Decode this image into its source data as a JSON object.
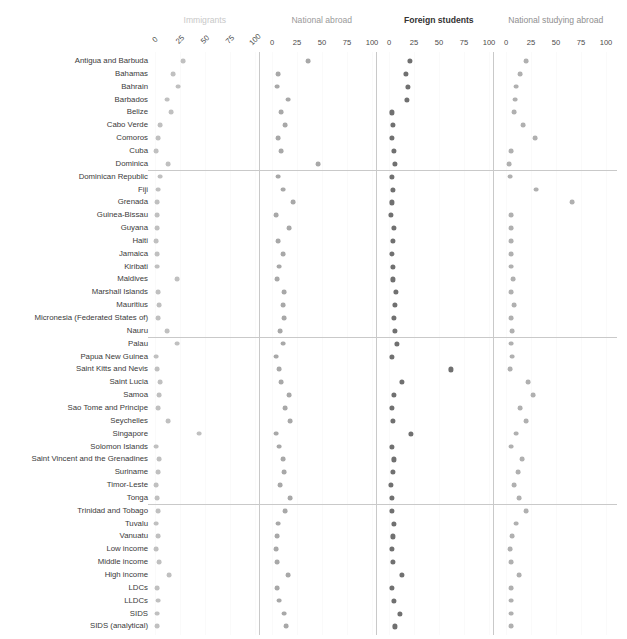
{
  "title": "",
  "facets": [
    {
      "key": "immigrants",
      "label": "Immigrants",
      "color": "#c8c8c8",
      "bold": false,
      "ticks": [
        "0",
        "25",
        "50",
        "75",
        "100"
      ],
      "rotated": true
    },
    {
      "key": "national_abroad",
      "label": "National abroad",
      "color": "#9a9a9a",
      "bold": false,
      "ticks": [
        "0",
        "25",
        "50",
        "75",
        "100"
      ],
      "rotated": false
    },
    {
      "key": "foreign_students",
      "label": "Foreign students",
      "color": "#333333",
      "bold": true,
      "ticks": [
        "0",
        "25",
        "50",
        "75",
        "100"
      ],
      "rotated": false
    },
    {
      "key": "national_studying_abroad",
      "label": "National studying abroad",
      "color": "#8f8f8f",
      "bold": false,
      "ticks": [
        "0",
        "25",
        "50",
        "75",
        "100"
      ],
      "rotated": false
    }
  ],
  "axis": {
    "min": 0,
    "max": 100,
    "tick_step": 25
  },
  "group_separator_rows": [
    9,
    22,
    35
  ],
  "chart_data": {
    "type": "scatter",
    "title": "",
    "xlabel": "",
    "ylabel": "",
    "xlim": [
      0,
      100
    ],
    "grid": true,
    "legend": "none",
    "categories": [
      "Antigua and Barbuda",
      "Bahamas",
      "Bahrain",
      "Barbados",
      "Belize",
      "Cabo Verde",
      "Comoros",
      "Cuba",
      "Dominica",
      "Dominican Republic",
      "Fiji",
      "Grenada",
      "Guinea-Bissau",
      "Guyana",
      "Haiti",
      "Jamaica",
      "Kiribati",
      "Maldives",
      "Marshall Islands",
      "Mauritius",
      "Micronesia (Federated States of)",
      "Nauru",
      "Palau",
      "Papua New Guinea",
      "Saint Kitts and Nevis",
      "Saint Lucia",
      "Samoa",
      "Sao Tome and Principe",
      "Seychelles",
      "Singapore",
      "Solomon Islands",
      "Saint Vincent and the Grenadines",
      "Suriname",
      "Timor-Leste",
      "Tonga",
      "Trinidad and Tobago",
      "Tuvalu",
      "Vanuatu",
      "Low income",
      "Middle income",
      "High income",
      "LDCs",
      "LLDCs",
      "SIDS",
      "SIDS (analytical)"
    ],
    "series": [
      {
        "name": "Immigrants",
        "color": "#c0c0c0",
        "values": [
          28,
          18,
          23,
          12,
          16,
          5,
          3,
          1,
          13,
          5,
          3,
          2,
          2,
          2,
          1,
          2,
          2,
          22,
          3,
          4,
          3,
          12,
          22,
          1,
          2,
          5,
          4,
          3,
          13,
          44,
          1,
          4,
          3,
          1,
          2,
          3,
          1,
          3,
          1,
          4,
          14,
          2,
          3,
          2,
          2
        ]
      },
      {
        "name": "National abroad",
        "color": "#a8a8a8",
        "values": [
          36,
          6,
          5,
          16,
          9,
          13,
          6,
          9,
          46,
          6,
          11,
          21,
          4,
          17,
          6,
          11,
          7,
          5,
          12,
          11,
          12,
          8,
          11,
          4,
          7,
          9,
          17,
          13,
          18,
          4,
          7,
          11,
          12,
          8,
          18,
          13,
          6,
          5,
          4,
          5,
          16,
          5,
          7,
          12,
          14
        ]
      },
      {
        "name": "Foreign students",
        "color": "#707070",
        "values": [
          21,
          17,
          19,
          18,
          3,
          4,
          3,
          5,
          6,
          3,
          4,
          3,
          2,
          5,
          4,
          3,
          4,
          4,
          7,
          6,
          5,
          6,
          8,
          3,
          62,
          13,
          5,
          3,
          4,
          22,
          3,
          5,
          4,
          2,
          3,
          3,
          5,
          4,
          3,
          4,
          13,
          3,
          5,
          11,
          6
        ]
      },
      {
        "name": "National studying abroad",
        "color": "#b0b0b0",
        "values": [
          20,
          14,
          10,
          9,
          8,
          17,
          29,
          5,
          3,
          4,
          30,
          66,
          5,
          5,
          5,
          5,
          5,
          7,
          5,
          8,
          5,
          6,
          5,
          6,
          4,
          22,
          27,
          14,
          20,
          10,
          5,
          16,
          12,
          8,
          13,
          20,
          10,
          6,
          4,
          5,
          13,
          5,
          5,
          5,
          5
        ]
      }
    ]
  }
}
